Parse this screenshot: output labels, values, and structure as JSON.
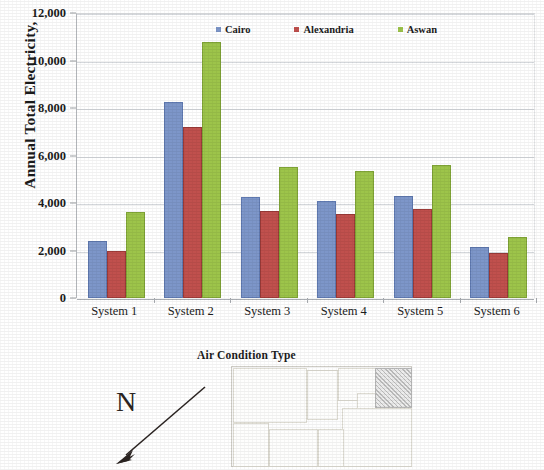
{
  "chart_data": {
    "type": "bar",
    "title": "",
    "xlabel": "",
    "ylabel": "Annual Total Electricity,",
    "ylim": [
      0,
      12000
    ],
    "ytick_labels": [
      "0",
      "2,000",
      "4,000",
      "6,000",
      "8,000",
      "10,000",
      "12,000"
    ],
    "ytick_values": [
      0,
      2000,
      4000,
      6000,
      8000,
      10000,
      12000
    ],
    "grid": true,
    "legend_position": "top-center",
    "categories": [
      "System 1",
      "System 2",
      "System 3",
      "System 4",
      "System 5",
      "System 6"
    ],
    "series": [
      {
        "name": "Cairo",
        "color": "#7d96c9",
        "values": [
          2300,
          8150,
          4150,
          4000,
          4230,
          2050
        ]
      },
      {
        "name": "Alexandria",
        "color": "#c0504d",
        "values": [
          1900,
          7100,
          3600,
          3450,
          3670,
          1820
        ]
      },
      {
        "name": "Aswan",
        "color": "#9dc44a",
        "values": [
          3520,
          10700,
          5450,
          5250,
          5500,
          2500
        ]
      }
    ]
  },
  "figure": {
    "floorplan_caption": "Air Condition Type",
    "north_label": "N"
  }
}
